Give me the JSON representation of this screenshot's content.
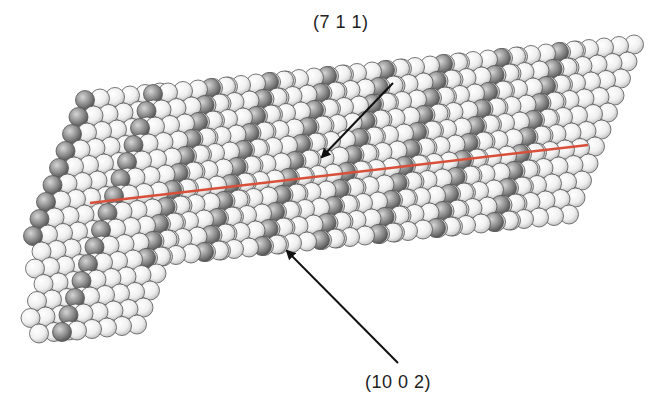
{
  "figure": {
    "type": "crystal-surface-atomic-model",
    "background": "#ffffff",
    "labels": {
      "top": "(7 1 1)",
      "bottom": "(10 0 2)"
    },
    "colors": {
      "light_atom": "#f2f2f2",
      "dark_atom": "#8a8a8a",
      "atom_outline": "#555555",
      "red_line": "#d9503a",
      "arrow": "#111111"
    },
    "red_line": {
      "x1": 90,
      "y1": 203,
      "x2": 588,
      "y2": 145
    },
    "arrows": [
      {
        "name": "arrow-711",
        "x1": 393,
        "y1": 83,
        "x2": 322,
        "y2": 157
      },
      {
        "name": "arrow-1002",
        "x1": 398,
        "y1": 363,
        "x2": 287,
        "y2": 251
      }
    ]
  }
}
